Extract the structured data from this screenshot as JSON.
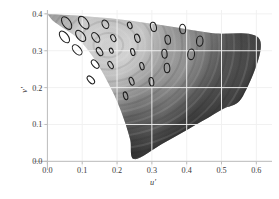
{
  "chart_data": {
    "type": "scatter",
    "title": "",
    "subtitle": "",
    "xlabel": "u′",
    "ylabel": "v′",
    "xlim": [
      -0.0385,
      0.645
    ],
    "ylim": [
      -0.0235,
      0.4105
    ],
    "xticks": [
      0.0,
      0.1,
      0.2,
      0.3,
      0.4,
      0.5,
      0.6
    ],
    "xtick_labels": [
      "0.0",
      "0.1",
      "0.2",
      "0.3",
      "0.4",
      "0.5",
      "0.6"
    ],
    "yticks": [
      0.0,
      0.1,
      0.2,
      0.3,
      0.4
    ],
    "ytick_labels": [
      "0.0",
      "0.1",
      "0.2",
      "0.3",
      "0.4"
    ],
    "grid": true,
    "grid_color": "#f0f0f0",
    "axis_color": "#bdbdbd",
    "legend": null,
    "legend_position": "none",
    "gamut": {
      "name": "spectral-locus",
      "fill": "greyscale-chromaticity",
      "bright_point": [
        0.175,
        0.315
      ],
      "outline_points": [
        [
          0.0,
          0.4
        ],
        [
          0.015,
          0.382
        ],
        [
          0.045,
          0.362
        ],
        [
          0.082,
          0.338
        ],
        [
          0.118,
          0.3
        ],
        [
          0.148,
          0.258
        ],
        [
          0.175,
          0.212
        ],
        [
          0.2,
          0.163
        ],
        [
          0.222,
          0.108
        ],
        [
          0.238,
          0.058
        ],
        [
          0.25,
          0.006
        ],
        [
          0.33,
          0.048
        ],
        [
          0.42,
          0.096
        ],
        [
          0.5,
          0.14
        ],
        [
          0.562,
          0.178
        ],
        [
          0.61,
          0.33
        ],
        [
          0.47,
          0.348
        ],
        [
          0.34,
          0.368
        ],
        [
          0.21,
          0.385
        ],
        [
          0.1,
          0.394
        ],
        [
          0.0,
          0.4
        ]
      ]
    },
    "ellipses": [
      {
        "cx": 0.0552,
        "cy": 0.3752,
        "rx": 0.0112,
        "ry": 0.0206,
        "angle": -34
      },
      {
        "cx": 0.1043,
        "cy": 0.3763,
        "rx": 0.0114,
        "ry": 0.0208,
        "angle": -36
      },
      {
        "cx": 0.1665,
        "cy": 0.3719,
        "rx": 0.0087,
        "ry": 0.0129,
        "angle": -28
      },
      {
        "cx": 0.2365,
        "cy": 0.3688,
        "rx": 0.0062,
        "ry": 0.0098,
        "angle": -20
      },
      {
        "cx": 0.3045,
        "cy": 0.3648,
        "rx": 0.0083,
        "ry": 0.0136,
        "angle": -14
      },
      {
        "cx": 0.3885,
        "cy": 0.3589,
        "rx": 0.0086,
        "ry": 0.0139,
        "angle": -6
      },
      {
        "cx": 0.0489,
        "cy": 0.3374,
        "rx": 0.0107,
        "ry": 0.0196,
        "angle": -38
      },
      {
        "cx": 0.0955,
        "cy": 0.3402,
        "rx": 0.0106,
        "ry": 0.0189,
        "angle": -40
      },
      {
        "cx": 0.1388,
        "cy": 0.3361,
        "rx": 0.0092,
        "ry": 0.0158,
        "angle": -34
      },
      {
        "cx": 0.1892,
        "cy": 0.3342,
        "rx": 0.0065,
        "ry": 0.0106,
        "angle": -26
      },
      {
        "cx": 0.2582,
        "cy": 0.3338,
        "rx": 0.0071,
        "ry": 0.0122,
        "angle": -18
      },
      {
        "cx": 0.3455,
        "cy": 0.3299,
        "rx": 0.0079,
        "ry": 0.0131,
        "angle": -8
      },
      {
        "cx": 0.4375,
        "cy": 0.3261,
        "rx": 0.0094,
        "ry": 0.0146,
        "angle": 4
      },
      {
        "cx": 0.0855,
        "cy": 0.3023,
        "rx": 0.0101,
        "ry": 0.0176,
        "angle": -42
      },
      {
        "cx": 0.1498,
        "cy": 0.2978,
        "rx": 0.0073,
        "ry": 0.0128,
        "angle": -32
      },
      {
        "cx": 0.1835,
        "cy": 0.3001,
        "rx": 0.0049,
        "ry": 0.0077,
        "angle": -24
      },
      {
        "cx": 0.2452,
        "cy": 0.2965,
        "rx": 0.0057,
        "ry": 0.0104,
        "angle": -16
      },
      {
        "cx": 0.3362,
        "cy": 0.2918,
        "rx": 0.0075,
        "ry": 0.0128,
        "angle": -6
      },
      {
        "cx": 0.4128,
        "cy": 0.2902,
        "rx": 0.0098,
        "ry": 0.0152,
        "angle": 6
      },
      {
        "cx": 0.1372,
        "cy": 0.2638,
        "rx": 0.0078,
        "ry": 0.0142,
        "angle": -40
      },
      {
        "cx": 0.1815,
        "cy": 0.2612,
        "rx": 0.0061,
        "ry": 0.0113,
        "angle": -30
      },
      {
        "cx": 0.2715,
        "cy": 0.2581,
        "rx": 0.0058,
        "ry": 0.0108,
        "angle": -14
      },
      {
        "cx": 0.3435,
        "cy": 0.2532,
        "rx": 0.0081,
        "ry": 0.0134,
        "angle": -4
      },
      {
        "cx": 0.1248,
        "cy": 0.2208,
        "rx": 0.0074,
        "ry": 0.0134,
        "angle": -42
      },
      {
        "cx": 0.2418,
        "cy": 0.2172,
        "rx": 0.0062,
        "ry": 0.0118,
        "angle": -20
      },
      {
        "cx": 0.2988,
        "cy": 0.2158,
        "rx": 0.0066,
        "ry": 0.0124,
        "angle": -10
      },
      {
        "cx": 0.2245,
        "cy": 0.1778,
        "rx": 0.0059,
        "ry": 0.0115,
        "angle": -16
      }
    ]
  },
  "axes": {
    "x_title": "u′",
    "y_title": "v′"
  }
}
